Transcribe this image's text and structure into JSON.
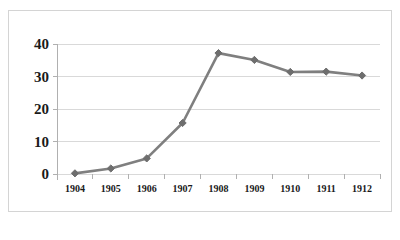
{
  "chart_data": {
    "type": "line",
    "title": "",
    "subtitle": "",
    "xlabel": "",
    "ylabel": "",
    "categories": [
      "1904",
      "1905",
      "1906",
      "1907",
      "1908",
      "1909",
      "1910",
      "1911",
      "1912"
    ],
    "values": [
      0.2,
      1.7,
      4.8,
      15.7,
      37.2,
      35.1,
      31.4,
      31.5,
      30.3
    ],
    "ylim": [
      0,
      40
    ],
    "yticks": [
      "0",
      "10",
      "20",
      "30",
      "40"
    ],
    "ytick_values": [
      0,
      10,
      20,
      30,
      40
    ],
    "grid": true,
    "grid_axis": "y",
    "legend": false,
    "legend_position": "none",
    "series": [
      {
        "name": "",
        "values": [
          0.2,
          1.7,
          4.8,
          15.7,
          37.2,
          35.1,
          31.4,
          31.5,
          30.3
        ]
      }
    ],
    "marker": "diamond",
    "colors": {
      "line": "#7f7f7f",
      "marker": "#6e6e6e",
      "grid": "#d9d9d9",
      "axis": "#b0b0b0",
      "text": "#1a1a1a",
      "border": "#d4d4d4",
      "background": "#ffffff"
    }
  },
  "frame": {
    "border_color": "#d4d4d4"
  }
}
